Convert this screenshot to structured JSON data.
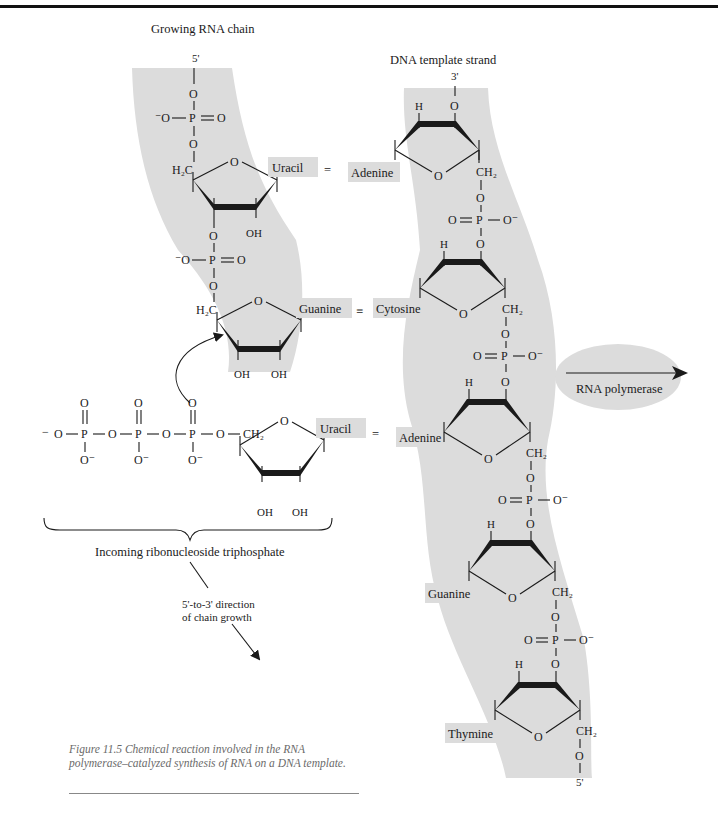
{
  "labels": {
    "rna_chain_title": "Growing RNA chain",
    "dna_strand_title": "DNA template strand",
    "rna_5prime": "5'",
    "dna_3prime": "3'",
    "dna_5prime": "5'",
    "incoming": "Incoming ribonucleoside triphosphate",
    "direction_line1": "5'-to-3' direction",
    "direction_line2": "of chain growth",
    "polymerase": "RNA polymerase"
  },
  "rna_bases": [
    "Uracil",
    "Guanine"
  ],
  "incoming_base": "Uracil",
  "dna_bases": [
    "Adenine",
    "Cytosine",
    "Adenine",
    "Guanine",
    "Thymine"
  ],
  "pair_bonds": [
    "=",
    "≡",
    "="
  ],
  "atoms": {
    "O": "O",
    "P": "P",
    "OH": "OH",
    "H": "H",
    "CH2": "CH₂",
    "H2C": "H₂C",
    "O_minus": "O⁻",
    "minus_O": "⁻O",
    "minus": "−"
  },
  "caption": "Figure 11.5 Chemical reaction involved in the RNA polymerase–catalyzed synthesis of RNA on a DNA template.",
  "colors": {
    "shade": "#dcdcdc",
    "ink": "#1a1a1a",
    "caption": "#6a6a6a"
  }
}
